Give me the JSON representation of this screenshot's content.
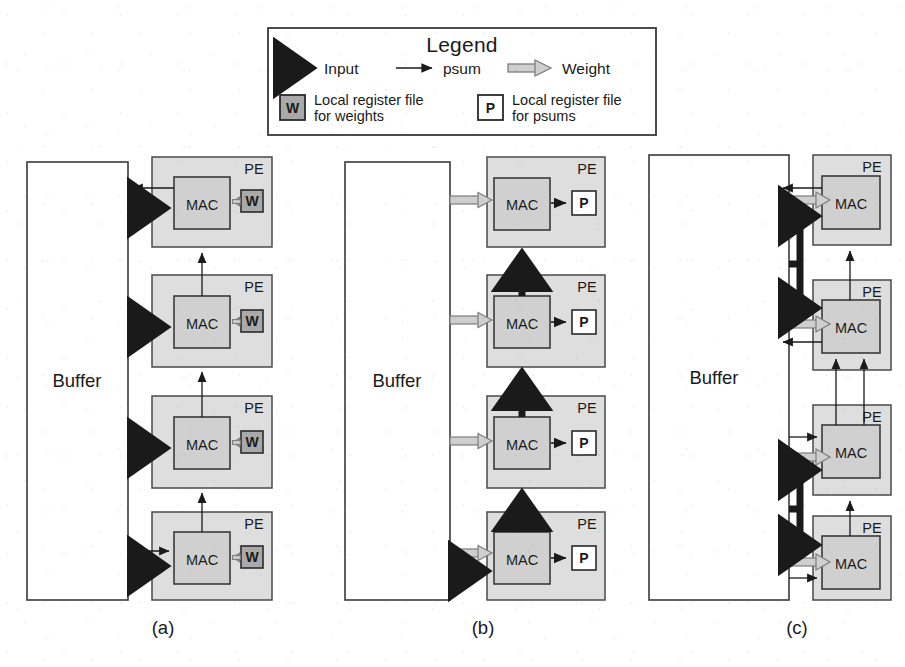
{
  "figure": {
    "kind": "dataflow-architecture-diagram",
    "panel_labels": [
      "(a)",
      "(b)",
      "(c)"
    ]
  },
  "legend": {
    "title": "Legend",
    "arrows": [
      {
        "name": "input",
        "label": "Input",
        "style": "thick-solid-black",
        "color": "#1a1a1a"
      },
      {
        "name": "psum",
        "label": "psum",
        "style": "thin-solid-black",
        "color": "#1a1a1a"
      },
      {
        "name": "weight",
        "label": "Weight",
        "style": "hollow-gray-outline",
        "color": "#9a9a9a"
      }
    ],
    "register_files": [
      {
        "glyph": "W",
        "line1": "Local register file",
        "line2": "for weights",
        "fill": "#a9a9a9"
      },
      {
        "glyph": "P",
        "line1": "Local register file",
        "line2": "for psums",
        "fill": "#ffffff"
      }
    ]
  },
  "labels": {
    "buffer": "Buffer",
    "pe": "PE",
    "mac": "MAC",
    "w": "W",
    "p": "P"
  },
  "colors": {
    "pe_fill": "#dedede",
    "mac_fill": "#d0d0d0",
    "w_fill": "#a9a9a9",
    "p_fill": "#ffffff",
    "buffer_fill": "#ffffff",
    "stroke": "#3a3a3a",
    "ink": "#1a1a1a",
    "weight_arrow": "#9a9a9a"
  },
  "panels": [
    {
      "id": "a",
      "label": "(a)",
      "dataflow": "weight-stationary",
      "buffer": {
        "label": "Buffer"
      },
      "pe_count": 4,
      "pe_register_file": "W",
      "flows": [
        "Input from Buffer into each MAC (thick arrow)",
        "Weight from local W register file into MAC (hollow arrow)",
        "psum chained upward from MAC to MAC (thin arrow)",
        "psum from Buffer into bottom MAC (thin arrow)",
        "psum from top MAC back to Buffer (thin arrow)"
      ]
    },
    {
      "id": "b",
      "label": "(b)",
      "dataflow": "output-stationary",
      "buffer": {
        "label": "Buffer"
      },
      "pe_count": 4,
      "pe_register_file": "P",
      "flows": [
        "Weight from Buffer into each MAC (hollow arrow)",
        "psum from MAC into local P register file (thin arrow)",
        "Input chained upward from MAC to MAC (thick arrow)",
        "Input from Buffer into bottom MAC (thick arrow)"
      ]
    },
    {
      "id": "c",
      "label": "(c)",
      "dataflow": "no-local-reuse",
      "buffer": {
        "label": "Buffer"
      },
      "pe_count": 4,
      "pe_register_file": null,
      "flows": [
        "Weight from Buffer into each MAC (hollow arrow)",
        "Input from Buffer branching into two MACs (thick arrow)",
        "psum chained upward from MAC to MAC (thin arrow)",
        "psum from Buffer into MACs (thin arrow)",
        "psum from MACs back to Buffer (thin arrow)"
      ]
    }
  ]
}
